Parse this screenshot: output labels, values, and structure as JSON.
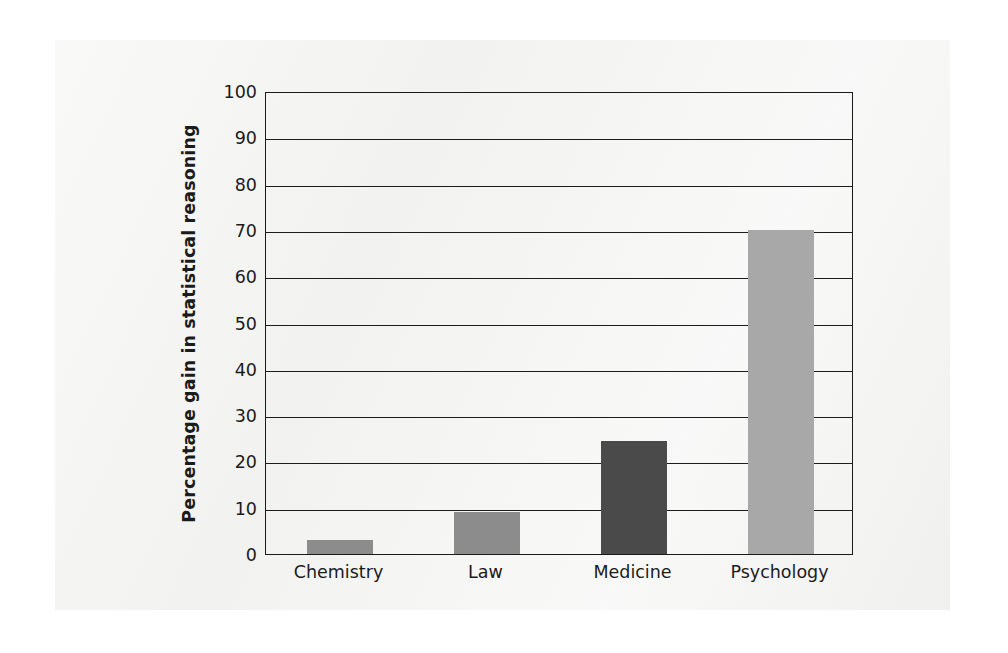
{
  "figure": {
    "background_color": "#f2f2f1",
    "page_color": "#ffffff",
    "axis_color": "#1a1a1a"
  },
  "chart_data": {
    "type": "bar",
    "title": "",
    "subtitle": "",
    "xlabel": "",
    "ylabel": "Percentage gain in statistical reasoning",
    "categories": [
      "Chemistry",
      "Law",
      "Medicine",
      "Psychology"
    ],
    "values": [
      3,
      9,
      24.5,
      70
    ],
    "bar_colors": [
      "#8c8c8c",
      "#8c8c8c",
      "#4a4a4a",
      "#a8a8a8"
    ],
    "ylim": [
      0,
      100
    ],
    "ytick_labels": [
      "0",
      "10",
      "20",
      "30",
      "40",
      "50",
      "60",
      "70",
      "80",
      "90",
      "100"
    ],
    "ytick_values": [
      0,
      10,
      20,
      30,
      40,
      50,
      60,
      70,
      80,
      90,
      100
    ],
    "grid": true,
    "grid_axis": "y",
    "legend": false,
    "legend_position": "none",
    "annotations": []
  }
}
